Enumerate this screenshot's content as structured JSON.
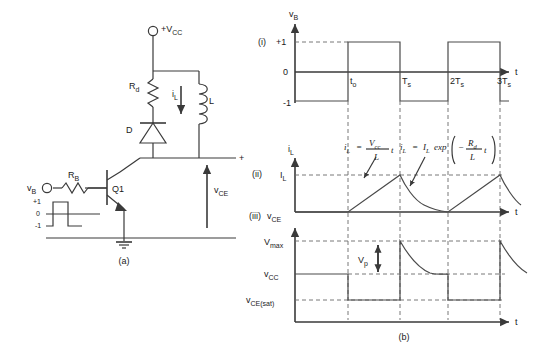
{
  "figure": {
    "panel_a": {
      "caption": "(a)",
      "supply_label": "+V",
      "supply_sub": "CC",
      "resistor_collector": {
        "label": "R",
        "sub": "d"
      },
      "resistor_base": {
        "label": "R",
        "sub": "B"
      },
      "diode": "D",
      "inductor": "L",
      "inductor_current": {
        "label": "i",
        "sub": "L"
      },
      "transistor": "Q1",
      "input_source": {
        "label": "v",
        "sub": "B"
      },
      "output_voltage": {
        "label": "v",
        "sub": "CE"
      },
      "output_polarity": "+",
      "input_wave_levels": [
        "+1",
        "0",
        "-1"
      ]
    },
    "panel_b": {
      "caption": "(b)",
      "rows": [
        {
          "marker": "(i)",
          "yaxis": {
            "label": "v",
            "sub": "B"
          },
          "xaxis": "t",
          "ylevels": [
            "+1",
            "0",
            "-1"
          ],
          "xticks": [
            "t",
            "T",
            "2T",
            "3T"
          ],
          "xtick_subs": [
            "o",
            "s",
            "s",
            "s"
          ]
        },
        {
          "marker": "(ii)",
          "yaxis": {
            "label": "i",
            "sub": "L"
          },
          "xaxis": "t",
          "ylevels": [
            "I",
            "L"
          ],
          "equation_rise": {
            "lhs": "i",
            "lhs_sub": "L",
            "eq": "=",
            "num": "V",
            "num_sub": "cc",
            "den": "L",
            "tail": "t"
          },
          "equation_decay": {
            "lhs": "i",
            "lhs_sub": "L",
            "eq": "=",
            "amp": "I",
            "amp_sub": "L",
            "fn": "exp",
            "sign": "−",
            "num": "R",
            "num_sub": "d",
            "den": "L",
            "tail": "t"
          }
        },
        {
          "marker": "(iii)",
          "yaxis": {
            "label": "v",
            "sub": "CE"
          },
          "xaxis": "t",
          "ylevels": [
            {
              "label": "V",
              "sub": "max"
            },
            {
              "label": "v",
              "sub": "CC"
            },
            {
              "label": "v",
              "sub": "CE(sat)"
            }
          ],
          "peak_marker": {
            "label": "V",
            "sub": "p"
          }
        }
      ]
    }
  }
}
